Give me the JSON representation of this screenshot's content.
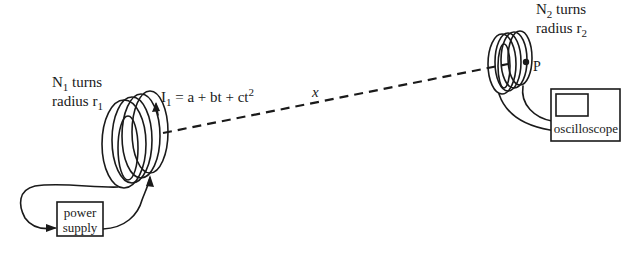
{
  "diagram": {
    "coil1": {
      "turns_label": "N",
      "turns_sub": "1",
      "turns_suffix": " turns",
      "radius_label": "radius r",
      "radius_sub": "1"
    },
    "current": {
      "lhs": "I",
      "lhs_sub": "1",
      "rhs": " = a + bt + ct",
      "exp": "2"
    },
    "distance": {
      "label": "x"
    },
    "coil2": {
      "turns_label": "N",
      "turns_sub": "2",
      "turns_suffix": " turns",
      "radius_label": "radius r",
      "radius_sub": "2",
      "point_label": "P"
    },
    "power_supply": {
      "line1": "power",
      "line2": "supply"
    },
    "oscilloscope": {
      "label": "oscilloscope"
    },
    "colors": {
      "ink": "#1a1a1a",
      "background": "#ffffff"
    }
  }
}
